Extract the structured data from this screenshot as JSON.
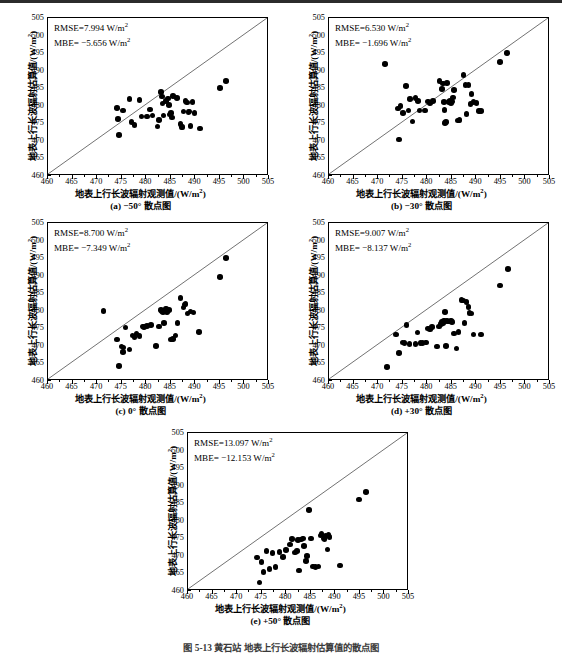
{
  "figure": {
    "caption": "图 5-13    黄石站  地表上行长波辐射估算值的散点图",
    "axis_labels": {
      "x": "地表上行长波辐射观测值/(W/m",
      "x_sup": "2",
      "x_tail": ")",
      "y": "地表上行长波辐射估算值/(W/m",
      "y_sup": "2",
      "y_tail": ")"
    },
    "ticks": {
      "x": [
        "460",
        "465",
        "470",
        "475",
        "480",
        "485",
        "490",
        "495",
        "500",
        "505"
      ],
      "y": [
        "460",
        "465",
        "470",
        "475",
        "480",
        "485",
        "490",
        "495",
        "500",
        "505"
      ]
    },
    "axis_range": {
      "xmin": 460,
      "xmax": 505,
      "ymin": 460,
      "ymax": 505
    },
    "unit": "W/m2"
  },
  "chart_data": [
    {
      "id": "a",
      "type": "scatter",
      "title": "(a) −50° 散点图",
      "caption": "(a) −50° 散点图",
      "angle": "-50°",
      "rmse_label": "RMSE=7.994 W/m",
      "mbe_label": "MBE= −5.656 W/m",
      "rmse": 7.994,
      "mbe": -5.656,
      "xlabel": "地表上行长波辐射观测值/(W/m2)",
      "ylabel": "地表上行长波辐射估算值/(W/m2)",
      "xlim": [
        460,
        505
      ],
      "ylim": [
        460,
        505
      ],
      "grid": false,
      "reference_line": "1:1",
      "points": [
        [
          474.0,
          479.3
        ],
        [
          474.2,
          476.3
        ],
        [
          474.4,
          471.6
        ],
        [
          475.3,
          478.6
        ],
        [
          476.6,
          482.0
        ],
        [
          477.0,
          475.4
        ],
        [
          477.6,
          474.5
        ],
        [
          478.6,
          481.6
        ],
        [
          479.0,
          477.0
        ],
        [
          480.2,
          476.9
        ],
        [
          480.8,
          478.9
        ],
        [
          481.3,
          477.2
        ],
        [
          482.3,
          474.1
        ],
        [
          482.6,
          475.9
        ],
        [
          483.0,
          483.9
        ],
        [
          483.2,
          482.6
        ],
        [
          483.3,
          480.6
        ],
        [
          483.5,
          477.2
        ],
        [
          484.0,
          481.4
        ],
        [
          484.4,
          482.1
        ],
        [
          484.6,
          480.3
        ],
        [
          484.8,
          477.5
        ],
        [
          485.0,
          477.9
        ],
        [
          485.2,
          476.7
        ],
        [
          485.4,
          482.8
        ],
        [
          486.3,
          482.2
        ],
        [
          487.0,
          474.8
        ],
        [
          487.2,
          474.0
        ],
        [
          487.4,
          473.9
        ],
        [
          487.6,
          478.4
        ],
        [
          488.0,
          481.4
        ],
        [
          488.3,
          480.9
        ],
        [
          488.6,
          478.2
        ],
        [
          488.8,
          478.4
        ],
        [
          489.0,
          474.2
        ],
        [
          489.4,
          481.0
        ],
        [
          489.8,
          478.0
        ],
        [
          491.0,
          473.5
        ],
        [
          495.0,
          485.1
        ],
        [
          496.3,
          487.0
        ]
      ]
    },
    {
      "id": "b",
      "type": "scatter",
      "title": "(b) −30° 散点图",
      "caption": "(b) −30° 散点图",
      "angle": "-30°",
      "rmse_label": "RMSE=6.530 W/m",
      "mbe_label": "MBE= −1.696 W/m",
      "rmse": 6.53,
      "mbe": -1.696,
      "xlabel": "地表上行长波辐射观测值/(W/m2)",
      "ylabel": "地表上行长波辐射估算值/(W/m2)",
      "xlim": [
        460,
        505
      ],
      "ylim": [
        460,
        505
      ],
      "grid": false,
      "reference_line": "1:1",
      "points": [
        [
          471.4,
          491.9
        ],
        [
          474.0,
          479.2
        ],
        [
          474.3,
          470.4
        ],
        [
          474.6,
          479.9
        ],
        [
          475.1,
          478.0
        ],
        [
          475.7,
          485.6
        ],
        [
          476.2,
          478.7
        ],
        [
          476.5,
          481.9
        ],
        [
          477.0,
          475.5
        ],
        [
          477.6,
          482.2
        ],
        [
          478.1,
          481.4
        ],
        [
          478.4,
          478.6
        ],
        [
          479.6,
          478.6
        ],
        [
          480.2,
          481.2
        ],
        [
          480.6,
          480.8
        ],
        [
          481.2,
          481.4
        ],
        [
          482.5,
          487.0
        ],
        [
          483.0,
          484.8
        ],
        [
          483.2,
          486.3
        ],
        [
          483.4,
          481.0
        ],
        [
          483.5,
          478.8
        ],
        [
          483.6,
          475.1
        ],
        [
          483.8,
          475.3
        ],
        [
          484.0,
          486.5
        ],
        [
          484.4,
          481.0
        ],
        [
          484.6,
          481.3
        ],
        [
          484.8,
          480.8
        ],
        [
          485.0,
          481.2
        ],
        [
          485.2,
          482.4
        ],
        [
          485.4,
          484.5
        ],
        [
          486.3,
          475.8
        ],
        [
          486.6,
          476.0
        ],
        [
          487.4,
          488.8
        ],
        [
          487.8,
          485.9
        ],
        [
          488.0,
          477.7
        ],
        [
          488.4,
          486.0
        ],
        [
          488.8,
          480.5
        ],
        [
          489.0,
          483.3
        ],
        [
          489.4,
          481.0
        ],
        [
          490.0,
          480.8
        ],
        [
          490.6,
          478.5
        ],
        [
          491.0,
          478.5
        ],
        [
          494.8,
          492.4
        ],
        [
          496.2,
          495.0
        ]
      ]
    },
    {
      "id": "c",
      "type": "scatter",
      "title": "(c) 0° 散点图",
      "caption": "(c) 0° 散点图",
      "angle": "0°",
      "rmse_label": "RMSE=8.700 W/m",
      "mbe_label": "MBE= −7.349 W/m",
      "rmse": 8.7,
      "mbe": -7.349,
      "xlabel": "地表上行长波辐射观测值/(W/m2)",
      "ylabel": "地表上行长波辐射估算值/(W/m2)",
      "xlim": [
        460,
        505
      ],
      "ylim": [
        460,
        505
      ],
      "grid": false,
      "reference_line": "1:1",
      "points": [
        [
          471.3,
          480.0
        ],
        [
          474.0,
          471.8
        ],
        [
          474.4,
          464.2
        ],
        [
          475.0,
          469.8
        ],
        [
          475.3,
          468.2
        ],
        [
          475.4,
          469.5
        ],
        [
          475.8,
          475.2
        ],
        [
          476.6,
          469.0
        ],
        [
          477.2,
          473.0
        ],
        [
          477.6,
          472.6
        ],
        [
          478.0,
          473.5
        ],
        [
          478.6,
          472.9
        ],
        [
          479.3,
          475.5
        ],
        [
          479.6,
          475.4
        ],
        [
          480.2,
          475.6
        ],
        [
          481.0,
          476.0
        ],
        [
          482.0,
          469.9
        ],
        [
          482.6,
          475.5
        ],
        [
          483.0,
          480.3
        ],
        [
          483.2,
          480.0
        ],
        [
          483.4,
          479.6
        ],
        [
          483.6,
          476.5
        ],
        [
          484.0,
          480.6
        ],
        [
          484.2,
          479.6
        ],
        [
          484.6,
          480.2
        ],
        [
          485.0,
          471.8
        ],
        [
          485.4,
          472.0
        ],
        [
          486.0,
          473.0
        ],
        [
          486.4,
          476.6
        ],
        [
          487.0,
          483.7
        ],
        [
          487.6,
          480.9
        ],
        [
          487.8,
          481.8
        ],
        [
          488.0,
          481.9
        ],
        [
          488.4,
          479.2
        ],
        [
          489.0,
          479.8
        ],
        [
          489.6,
          479.5
        ],
        [
          490.8,
          474.0
        ],
        [
          495.0,
          489.7
        ],
        [
          496.2,
          495.0
        ]
      ]
    },
    {
      "id": "d",
      "type": "scatter",
      "title": "(d) +30° 散点图",
      "caption": "(d) +30° 散点图",
      "angle": "+30°",
      "rmse_label": "RMSE=9.007 W/m",
      "mbe_label": "MBE= −8.137 W/m",
      "rmse": 9.007,
      "mbe": -8.137,
      "xlabel": "地表上行长波辐射观测值/(W/m2)",
      "ylabel": "地表上行长波辐射估算值/(W/m2)",
      "xlim": [
        460,
        505
      ],
      "ylim": [
        460,
        505
      ],
      "grid": false,
      "reference_line": "1:1",
      "points": [
        [
          471.8,
          464.0
        ],
        [
          473.6,
          473.3
        ],
        [
          474.2,
          467.9
        ],
        [
          475.0,
          471.0
        ],
        [
          475.4,
          470.9
        ],
        [
          475.8,
          475.9
        ],
        [
          476.4,
          470.6
        ],
        [
          477.6,
          470.6
        ],
        [
          478.0,
          473.8
        ],
        [
          478.6,
          470.8
        ],
        [
          479.0,
          470.8
        ],
        [
          479.8,
          471.0
        ],
        [
          480.2,
          474.9
        ],
        [
          480.6,
          474.7
        ],
        [
          481.0,
          475.3
        ],
        [
          482.0,
          469.8
        ],
        [
          482.4,
          475.5
        ],
        [
          482.8,
          476.3
        ],
        [
          483.0,
          477.0
        ],
        [
          483.2,
          476.6
        ],
        [
          483.4,
          477.2
        ],
        [
          483.6,
          479.6
        ],
        [
          483.8,
          469.9
        ],
        [
          484.0,
          477.1
        ],
        [
          484.4,
          477.0
        ],
        [
          484.8,
          477.2
        ],
        [
          485.0,
          476.8
        ],
        [
          485.4,
          473.5
        ],
        [
          486.0,
          469.2
        ],
        [
          486.4,
          474.0
        ],
        [
          487.0,
          483.0
        ],
        [
          487.3,
          482.9
        ],
        [
          487.6,
          476.6
        ],
        [
          488.0,
          482.5
        ],
        [
          488.4,
          481.0
        ],
        [
          488.6,
          479.3
        ],
        [
          489.0,
          479.2
        ],
        [
          489.4,
          473.2
        ],
        [
          491.0,
          473.3
        ],
        [
          494.8,
          487.2
        ],
        [
          496.4,
          491.9
        ]
      ]
    },
    {
      "id": "e",
      "type": "scatter",
      "title": "(e) +50° 散点图",
      "caption": "(e) +50° 散点图",
      "angle": "+50°",
      "rmse_label": "RMSE=13.097 W/m",
      "mbe_label": "MBE= −12.153 W/m",
      "rmse": 13.097,
      "mbe": -12.153,
      "xlabel": "地表上行长波辐射观测值/(W/m2)",
      "ylabel": "地表上行长波辐射估算值/(W/m2)",
      "xlim": [
        460,
        505
      ],
      "ylim": [
        460,
        505
      ],
      "grid": false,
      "reference_line": "1:1",
      "points": [
        [
          474.0,
          469.5
        ],
        [
          474.6,
          462.4
        ],
        [
          475.0,
          468.2
        ],
        [
          475.4,
          465.4
        ],
        [
          476.0,
          471.4
        ],
        [
          476.6,
          466.2
        ],
        [
          477.2,
          470.9
        ],
        [
          477.8,
          466.9
        ],
        [
          478.6,
          471.1
        ],
        [
          479.4,
          469.6
        ],
        [
          480.0,
          471.7
        ],
        [
          480.8,
          473.2
        ],
        [
          481.2,
          474.8
        ],
        [
          481.8,
          471.0
        ],
        [
          482.2,
          471.4
        ],
        [
          482.4,
          474.6
        ],
        [
          482.6,
          465.8
        ],
        [
          483.0,
          474.7
        ],
        [
          483.4,
          474.9
        ],
        [
          483.6,
          472.8
        ],
        [
          484.0,
          468.6
        ],
        [
          484.2,
          470.0
        ],
        [
          484.6,
          483.0
        ],
        [
          485.0,
          475.0
        ],
        [
          485.4,
          467.0
        ],
        [
          486.0,
          466.8
        ],
        [
          486.6,
          467.0
        ],
        [
          487.0,
          475.8
        ],
        [
          487.2,
          476.3
        ],
        [
          487.6,
          475.0
        ],
        [
          487.8,
          474.8
        ],
        [
          488.0,
          475.6
        ],
        [
          488.4,
          471.8
        ],
        [
          488.6,
          476.0
        ],
        [
          488.8,
          475.4
        ],
        [
          491.0,
          467.3
        ],
        [
          494.8,
          486.1
        ],
        [
          496.3,
          488.2
        ]
      ]
    }
  ]
}
